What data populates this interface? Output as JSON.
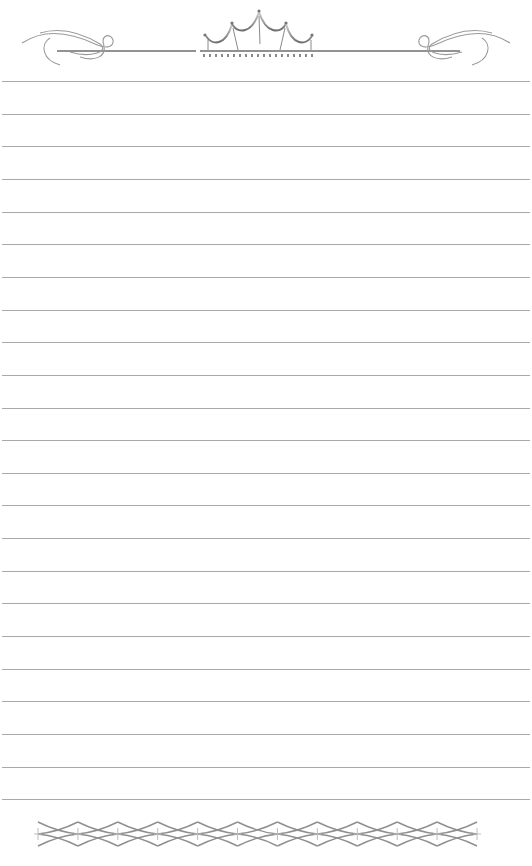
{
  "page": {
    "type": "ruled stationery sheet",
    "background": "#ffffff",
    "rule_color": "#a8a8a8",
    "ornament_color": "#8a8a8a",
    "rule_count": 23,
    "first_rule_y": 81,
    "rule_spacing": 32.65
  },
  "header": {
    "ornament": "crown-with-flourishes"
  },
  "footer": {
    "ornament": "diamond-chain-border",
    "diamond_count": 12
  }
}
